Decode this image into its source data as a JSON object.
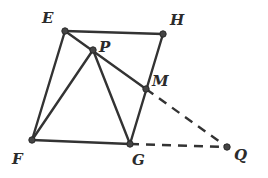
{
  "diagram": {
    "type": "geometry",
    "points": {
      "E": {
        "label": "E",
        "x": 65,
        "y": 31,
        "lx": 42,
        "ly": 23
      },
      "H": {
        "label": "H",
        "x": 163,
        "y": 34,
        "lx": 170,
        "ly": 25
      },
      "P": {
        "label": "P",
        "x": 93,
        "y": 50,
        "lx": 99,
        "ly": 52
      },
      "M": {
        "label": "M",
        "x": 146,
        "y": 89,
        "lx": 152,
        "ly": 86
      },
      "F": {
        "label": "F",
        "x": 32,
        "y": 140,
        "lx": 12,
        "ly": 164
      },
      "G": {
        "label": "G",
        "x": 130,
        "y": 144,
        "lx": 132,
        "ly": 165
      },
      "Q": {
        "label": "Q",
        "x": 227,
        "y": 147,
        "lx": 234,
        "ly": 160
      }
    },
    "solid_segments": [
      [
        "E",
        "H"
      ],
      [
        "H",
        "G"
      ],
      [
        "E",
        "F"
      ],
      [
        "F",
        "G"
      ],
      [
        "E",
        "M"
      ],
      [
        "P",
        "F"
      ],
      [
        "P",
        "G"
      ]
    ],
    "dashed_segments": [
      [
        "M",
        "Q"
      ],
      [
        "G",
        "Q"
      ]
    ],
    "colors": {
      "stroke": "#333333",
      "point": "#444444",
      "background": "#ffffff"
    }
  }
}
